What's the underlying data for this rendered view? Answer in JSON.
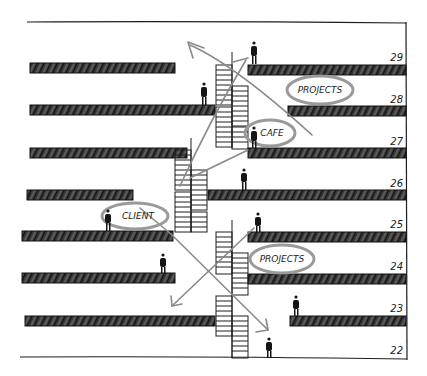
{
  "diagram": {
    "type": "architectural-section-sketch",
    "colors": {
      "ink": "#1e1e1e",
      "slab": "#2e2e2e",
      "arrow": "#8a8a8a",
      "bubble": "#9a9a9a",
      "paper": "#ffffff"
    },
    "floors": [
      {
        "number": "29",
        "label_y": 58
      },
      {
        "number": "28",
        "label_y": 100
      },
      {
        "number": "27",
        "label_y": 142
      },
      {
        "number": "26",
        "label_y": 184
      },
      {
        "number": "25",
        "label_y": 226
      },
      {
        "number": "24",
        "label_y": 268
      },
      {
        "number": "23",
        "label_y": 310
      },
      {
        "number": "22",
        "label_y": 352
      }
    ],
    "bubbles": [
      {
        "text": "PROJECTS",
        "floor": "28-29",
        "cx": 320,
        "cy": 90
      },
      {
        "text": "CAFE",
        "floor": "27",
        "cx": 270,
        "cy": 133
      },
      {
        "text": "CLIENT",
        "floor": "25",
        "cx": 135,
        "cy": 216
      },
      {
        "text": "PROJECTS",
        "floor": "24",
        "cx": 282,
        "cy": 259
      }
    ]
  }
}
